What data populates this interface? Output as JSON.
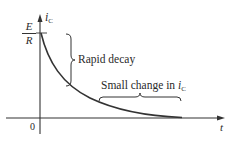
{
  "diagram": {
    "y_axis_label": {
      "symbol": "i",
      "subscript": "C"
    },
    "x_axis_label": "t",
    "origin_label": "0",
    "initial_value": {
      "numerator": "E",
      "denominator": "R"
    },
    "annotations": {
      "rapid_decay": "Rapid decay",
      "small_change": {
        "text": "Small change in ",
        "symbol": "i",
        "subscript": "C"
      }
    },
    "curve": {
      "type": "exponential-decay",
      "description": "i_C decays from E/R toward zero"
    },
    "colors": {
      "stroke": "#333333",
      "text": "#2a2a2a",
      "background": "#ffffff"
    }
  }
}
